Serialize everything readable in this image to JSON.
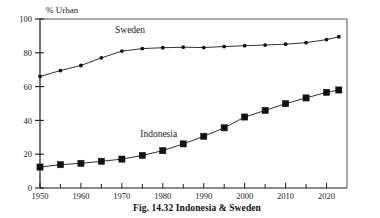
{
  "figure": {
    "caption": "Fig. 14.32 Indonesia & Sweden",
    "axis_title": "% Urban"
  },
  "chart_data": {
    "type": "line",
    "title": "",
    "subtitle": "",
    "xlabel": "",
    "ylabel": "% Urban",
    "ylim": [
      0,
      100
    ],
    "xlim": [
      1950,
      2025
    ],
    "yticks": [
      0,
      20,
      40,
      60,
      80,
      100
    ],
    "ytick_labels": [
      "0",
      "20",
      "40",
      "60",
      "80",
      "100"
    ],
    "xticks": [
      1950,
      1955,
      1960,
      1965,
      1970,
      1975,
      1980,
      1985,
      1990,
      1995,
      2000,
      2005,
      2010,
      2015,
      2020
    ],
    "xtick_labels_major": [
      "1950",
      "1960",
      "1970",
      "1980",
      "1990",
      "2000",
      "2010",
      "2020"
    ],
    "xticks_major": [
      1950,
      1960,
      1970,
      1980,
      1990,
      2000,
      2010,
      2020
    ],
    "grid": false,
    "legend": "annotations-on-plot",
    "x": [
      1950,
      1955,
      1960,
      1965,
      1970,
      1975,
      1980,
      1985,
      1990,
      1995,
      2000,
      2005,
      2010,
      2015,
      2020,
      2023
    ],
    "series": [
      {
        "name": "Sweden",
        "marker": "circle",
        "annotation_x": 1972,
        "annotation_y": 92,
        "values": [
          66,
          69.5,
          72.5,
          77,
          81,
          82.5,
          83,
          83.3,
          83.1,
          83.7,
          84.2,
          84.6,
          85.1,
          86,
          87.8,
          89.5
        ]
      },
      {
        "name": "Indonesia",
        "marker": "square",
        "annotation_x": 1979,
        "annotation_y": 30,
        "values": [
          12.4,
          13.8,
          14.6,
          15.8,
          17.1,
          19.3,
          22.1,
          26.1,
          30.6,
          35.6,
          42.0,
          45.9,
          49.9,
          53.3,
          56.6,
          58.0
        ]
      }
    ]
  }
}
